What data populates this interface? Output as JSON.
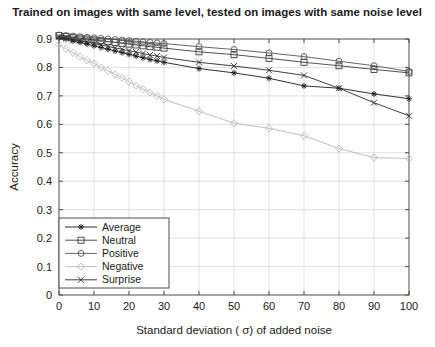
{
  "chart_data": {
    "type": "line",
    "title": "Trained on images with same level, tested on images with same noise level",
    "xlabel": "Standard deviation ( σ) of added noise",
    "ylabel": "Accuracy",
    "xlim": [
      0,
      100
    ],
    "ylim": [
      0,
      0.9
    ],
    "xticks": [
      0,
      10,
      20,
      30,
      40,
      50,
      60,
      70,
      80,
      90,
      100
    ],
    "xtick_labels": [
      "0",
      "10",
      "20",
      "30",
      "40",
      "50",
      "60",
      "70",
      "80",
      "90",
      "100"
    ],
    "yticks": [
      0,
      0.1,
      0.2,
      0.3,
      0.4,
      0.5,
      0.6,
      0.7,
      0.8,
      0.9
    ],
    "ytick_labels": [
      "0",
      "0.1",
      "0.2",
      "0.3",
      "0.4",
      "0.5",
      "0.6",
      "0.7",
      "0.8",
      "0.9"
    ],
    "grid": true,
    "legend_position": "lower left",
    "series": [
      {
        "name": "Average",
        "marker": "star",
        "color": "#1a1a1a",
        "x": [
          0,
          2,
          4,
          6,
          8,
          10,
          12,
          14,
          16,
          18,
          20,
          22,
          24,
          26,
          28,
          30,
          40,
          50,
          60,
          70,
          80,
          90,
          100
        ],
        "y": [
          0.905,
          0.899,
          0.893,
          0.888,
          0.882,
          0.876,
          0.87,
          0.864,
          0.858,
          0.852,
          0.846,
          0.84,
          0.834,
          0.828,
          0.823,
          0.818,
          0.796,
          0.781,
          0.762,
          0.735,
          0.727,
          0.707,
          0.69
        ]
      },
      {
        "name": "Neutral",
        "marker": "square",
        "color": "#3d3d3d",
        "x": [
          0,
          2,
          4,
          6,
          8,
          10,
          12,
          14,
          16,
          18,
          20,
          22,
          24,
          26,
          28,
          30,
          40,
          50,
          60,
          70,
          80,
          90,
          100
        ],
        "y": [
          0.912,
          0.909,
          0.906,
          0.903,
          0.9,
          0.897,
          0.894,
          0.891,
          0.888,
          0.885,
          0.882,
          0.879,
          0.876,
          0.873,
          0.871,
          0.868,
          0.855,
          0.845,
          0.832,
          0.818,
          0.806,
          0.793,
          0.781
        ]
      },
      {
        "name": "Positive",
        "marker": "circle",
        "color": "#555555",
        "x": [
          0,
          2,
          4,
          6,
          8,
          10,
          12,
          14,
          16,
          18,
          20,
          22,
          24,
          26,
          28,
          30,
          40,
          50,
          60,
          70,
          80,
          90,
          100
        ],
        "y": [
          0.914,
          0.912,
          0.91,
          0.908,
          0.906,
          0.904,
          0.902,
          0.9,
          0.898,
          0.896,
          0.894,
          0.892,
          0.89,
          0.888,
          0.886,
          0.884,
          0.873,
          0.863,
          0.851,
          0.838,
          0.822,
          0.806,
          0.786
        ]
      },
      {
        "name": "Negative",
        "marker": "diamond",
        "color": "#b8b8b8",
        "x": [
          0,
          2,
          4,
          6,
          8,
          10,
          12,
          14,
          16,
          18,
          20,
          22,
          24,
          26,
          28,
          30,
          40,
          50,
          60,
          70,
          80,
          90,
          100
        ],
        "y": [
          0.88,
          0.865,
          0.851,
          0.838,
          0.826,
          0.814,
          0.8,
          0.788,
          0.776,
          0.764,
          0.75,
          0.737,
          0.724,
          0.712,
          0.7,
          0.688,
          0.646,
          0.604,
          0.586,
          0.56,
          0.515,
          0.483,
          0.48
        ]
      },
      {
        "name": "Surprise",
        "marker": "cross",
        "color": "#2b2b2b",
        "x": [
          0,
          2,
          4,
          6,
          8,
          10,
          12,
          14,
          16,
          18,
          20,
          22,
          24,
          26,
          28,
          30,
          40,
          50,
          60,
          70,
          80,
          90,
          100
        ],
        "y": [
          0.908,
          0.903,
          0.898,
          0.894,
          0.889,
          0.884,
          0.879,
          0.874,
          0.869,
          0.864,
          0.859,
          0.854,
          0.849,
          0.844,
          0.84,
          0.835,
          0.818,
          0.805,
          0.79,
          0.772,
          0.727,
          0.676,
          0.63
        ]
      }
    ]
  },
  "legend": {
    "items": [
      "Average",
      "Neutral",
      "Positive",
      "Negative",
      "Surprise"
    ]
  }
}
